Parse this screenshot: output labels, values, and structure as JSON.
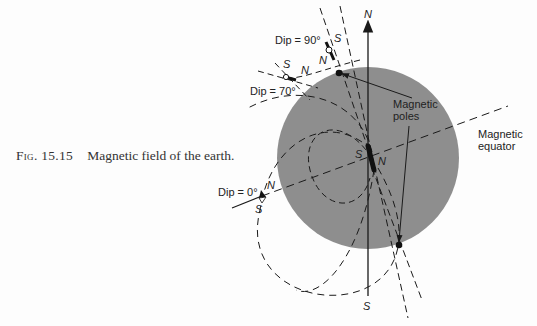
{
  "caption": {
    "figure_number": "Fig. 15.15",
    "text": "Magnetic field of the earth."
  },
  "labels": {
    "dip_90": "Dip = 90°",
    "dip_70": "Dip = 70°",
    "dip_0": "Dip = 0°",
    "magnetic_poles_line1": "Magnetic",
    "magnetic_poles_line2": "poles",
    "magnetic_equator_line1": "Magnetic",
    "magnetic_equator_line2": "equator",
    "geo_north": "N",
    "geo_south": "S",
    "compass_90_s": "S",
    "compass_90_n": "N",
    "compass_70_s": "S",
    "compass_70_n": "N",
    "compass_0_n": "N",
    "compass_0_s": "S",
    "magnet_s": "S",
    "magnet_n": "N"
  },
  "colors": {
    "earth": "#8e8e8e",
    "ink": "#1a1a1a",
    "background": "#fdfdfd"
  }
}
